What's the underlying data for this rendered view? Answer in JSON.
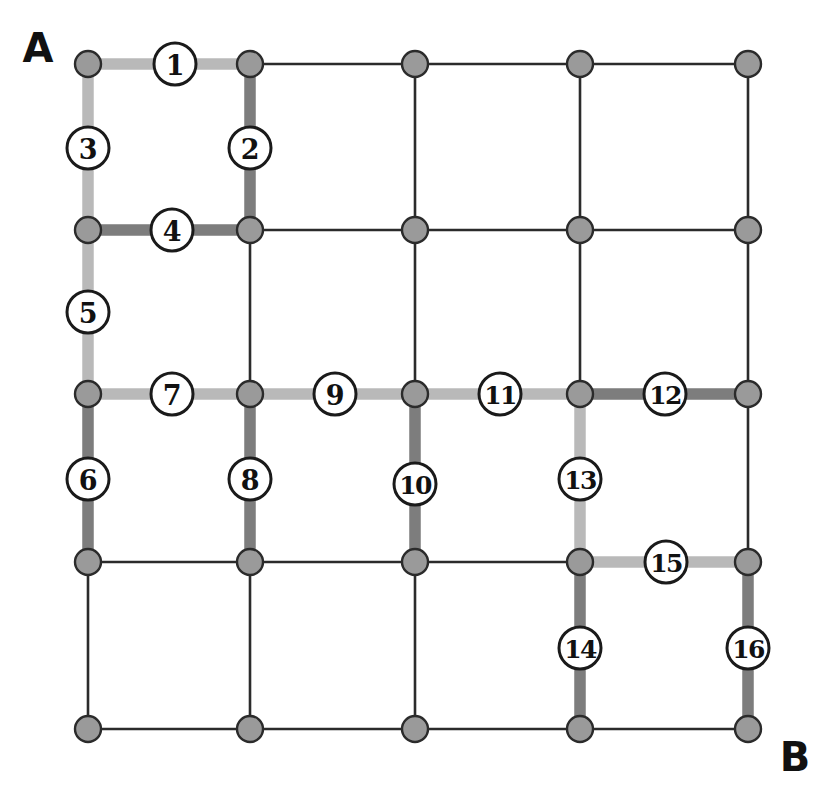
{
  "diagram": {
    "kind": "grid-graph-with-labeled-path-edges",
    "canvas": {
      "width": 835,
      "height": 801,
      "background": "#ffffff"
    },
    "grid": {
      "columns": 5,
      "rows": 5,
      "column_x": [
        88,
        250,
        415,
        580,
        748
      ],
      "row_y": [
        64,
        230,
        394,
        562,
        729
      ],
      "node_radius": 13,
      "node_fill": "#9a9a9a",
      "node_stroke": "#2b2b2b",
      "plain_edge_color": "#2b2b2b",
      "plain_edge_width": 2.6
    },
    "highlight_colors": {
      "light": "#b9b9b9",
      "dark": "#7d7d7d",
      "highlight_width": 11
    },
    "terminals": [
      {
        "name": "terminal-a",
        "label": "A",
        "x": 38,
        "y": 48
      },
      {
        "name": "terminal-b",
        "label": "B",
        "x": 795,
        "y": 757
      }
    ],
    "label_circle": {
      "radius": 21,
      "fill": "#ffffff",
      "stroke": "#1a1a1a",
      "stroke_width": 3.0
    },
    "edges": [
      {
        "id": 1,
        "label": "1",
        "from": [
          0,
          0
        ],
        "to": [
          1,
          0
        ],
        "orientation": "horizontal",
        "shade": "light",
        "label_x": 175,
        "label_y": 64
      },
      {
        "id": 2,
        "label": "2",
        "from": [
          1,
          0
        ],
        "to": [
          1,
          1
        ],
        "orientation": "vertical",
        "shade": "dark",
        "label_x": 250,
        "label_y": 148
      },
      {
        "id": 3,
        "label": "3",
        "from": [
          0,
          0
        ],
        "to": [
          0,
          1
        ],
        "orientation": "vertical",
        "shade": "light",
        "label_x": 88,
        "label_y": 148
      },
      {
        "id": 4,
        "label": "4",
        "from": [
          0,
          1
        ],
        "to": [
          1,
          1
        ],
        "orientation": "horizontal",
        "shade": "dark",
        "label_x": 172,
        "label_y": 230
      },
      {
        "id": 5,
        "label": "5",
        "from": [
          0,
          1
        ],
        "to": [
          0,
          2
        ],
        "orientation": "vertical",
        "shade": "light",
        "label_x": 88,
        "label_y": 312
      },
      {
        "id": 6,
        "label": "6",
        "from": [
          0,
          2
        ],
        "to": [
          0,
          3
        ],
        "orientation": "vertical",
        "shade": "dark",
        "label_x": 88,
        "label_y": 479
      },
      {
        "id": 7,
        "label": "7",
        "from": [
          0,
          2
        ],
        "to": [
          1,
          2
        ],
        "orientation": "horizontal",
        "shade": "light",
        "label_x": 172,
        "label_y": 394
      },
      {
        "id": 8,
        "label": "8",
        "from": [
          1,
          2
        ],
        "to": [
          1,
          3
        ],
        "orientation": "vertical",
        "shade": "dark",
        "label_x": 250,
        "label_y": 479
      },
      {
        "id": 9,
        "label": "9",
        "from": [
          1,
          2
        ],
        "to": [
          2,
          2
        ],
        "orientation": "horizontal",
        "shade": "light",
        "label_x": 335,
        "label_y": 394
      },
      {
        "id": 10,
        "label": "10",
        "from": [
          2,
          2
        ],
        "to": [
          2,
          3
        ],
        "orientation": "vertical",
        "shade": "dark",
        "label_x": 415,
        "label_y": 484
      },
      {
        "id": 11,
        "label": "11",
        "from": [
          2,
          2
        ],
        "to": [
          3,
          2
        ],
        "orientation": "horizontal",
        "shade": "light",
        "label_x": 500,
        "label_y": 394
      },
      {
        "id": 12,
        "label": "12",
        "from": [
          3,
          2
        ],
        "to": [
          4,
          2
        ],
        "orientation": "horizontal",
        "shade": "dark",
        "label_x": 665,
        "label_y": 394
      },
      {
        "id": 13,
        "label": "13",
        "from": [
          3,
          2
        ],
        "to": [
          3,
          3
        ],
        "orientation": "vertical",
        "shade": "light",
        "label_x": 580,
        "label_y": 479
      },
      {
        "id": 14,
        "label": "14",
        "from": [
          3,
          3
        ],
        "to": [
          3,
          4
        ],
        "orientation": "vertical",
        "shade": "dark",
        "label_x": 580,
        "label_y": 648
      },
      {
        "id": 15,
        "label": "15",
        "from": [
          3,
          3
        ],
        "to": [
          4,
          3
        ],
        "orientation": "horizontal",
        "shade": "light",
        "label_x": 666,
        "label_y": 562
      },
      {
        "id": 16,
        "label": "16",
        "from": [
          4,
          3
        ],
        "to": [
          4,
          4
        ],
        "orientation": "vertical",
        "shade": "dark",
        "label_x": 748,
        "label_y": 648
      }
    ]
  }
}
